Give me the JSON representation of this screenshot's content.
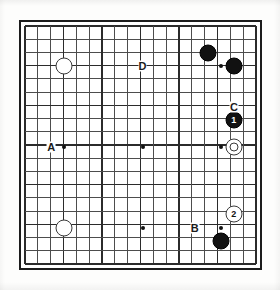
{
  "figure": {
    "kind": "go-board-diagram",
    "board_size": 19,
    "background_color": "#fdfdfc",
    "line_color": "#4a4a4a",
    "border_color": "#1c1c1c",
    "black_color": "#111111",
    "white_color": "#ffffff"
  },
  "board": {
    "hoshi_points": [
      {
        "col": 3,
        "row": 3
      },
      {
        "col": 9,
        "row": 3
      },
      {
        "col": 15,
        "row": 3
      },
      {
        "col": 3,
        "row": 9
      },
      {
        "col": 9,
        "row": 9
      },
      {
        "col": 15,
        "row": 9
      },
      {
        "col": 3,
        "row": 15
      },
      {
        "col": 9,
        "row": 15
      },
      {
        "col": 15,
        "row": 15
      }
    ],
    "stones": [
      {
        "id": "white-upper-left-hoshi",
        "color": "white",
        "col": 3,
        "row": 3,
        "label": "",
        "marked": false
      },
      {
        "id": "black-upper-right-a",
        "color": "black",
        "col": 14,
        "row": 2,
        "label": "",
        "marked": false
      },
      {
        "id": "black-upper-right-hoshi",
        "color": "black",
        "col": 16,
        "row": 3,
        "label": "",
        "marked": false
      },
      {
        "id": "black-move-1",
        "color": "black",
        "col": 16,
        "row": 7,
        "label": "1",
        "marked": false
      },
      {
        "id": "white-marked-right",
        "color": "white",
        "col": 16,
        "row": 9,
        "label": "",
        "marked": true
      },
      {
        "id": "white-move-2",
        "color": "white",
        "col": 16,
        "row": 14,
        "label": "2",
        "marked": false
      },
      {
        "id": "black-lower-right",
        "color": "black",
        "col": 15,
        "row": 16,
        "label": "",
        "marked": false
      },
      {
        "id": "white-lower-left-hoshi",
        "color": "white",
        "col": 3,
        "row": 15,
        "label": "",
        "marked": false
      }
    ],
    "point_labels": [
      {
        "id": "point-label-a",
        "text": "A",
        "col": 2,
        "row": 9
      },
      {
        "id": "point-label-b",
        "text": "B",
        "col": 13,
        "row": 15
      },
      {
        "id": "point-label-c",
        "text": "C",
        "col": 16,
        "row": 6
      },
      {
        "id": "point-label-d",
        "text": "D",
        "col": 9,
        "row": 3
      }
    ]
  }
}
